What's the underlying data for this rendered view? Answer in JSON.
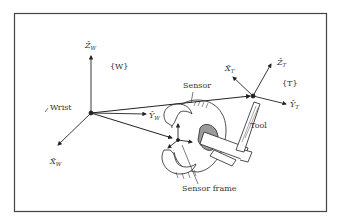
{
  "figure": {
    "frames": {
      "wrist": {
        "name": "Wrist",
        "frame_label": "{W}",
        "axes": {
          "x": {
            "hat": "X̂",
            "sub": "W"
          },
          "y": {
            "hat": "Ŷ",
            "sub": "W"
          },
          "z": {
            "hat": "Ẑ",
            "sub": "W"
          }
        }
      },
      "tool": {
        "name": "Tool",
        "frame_label": "{T}",
        "axes": {
          "x": {
            "hat": "X̂",
            "sub": "T"
          },
          "y": {
            "hat": "Ŷ",
            "sub": "T"
          },
          "z": {
            "hat": "Ẑ",
            "sub": "T"
          }
        }
      }
    },
    "labels": {
      "sensor": "Sensor",
      "sensor_frame": "Sensor frame",
      "tool": "Tool",
      "wrist": "Wrist"
    },
    "colors": {
      "line": "#222222",
      "border": "#444444",
      "text": "#333333",
      "shade": "#9a9a9a"
    }
  }
}
